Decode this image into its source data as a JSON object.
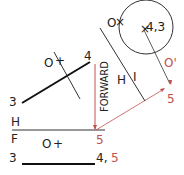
{
  "diagram": {
    "type": "descriptive-geometry-projection",
    "colors": {
      "ink": "#222222",
      "construction": "#c0504d",
      "background": "#ffffff"
    },
    "fold_lines": {
      "hf": {
        "top_label": "H",
        "bottom_label": "F"
      },
      "h1": {
        "left_label": "H",
        "right_label": "I"
      }
    },
    "direction_label": "FORWARD",
    "top_view": {
      "point_3": "3",
      "point_4": "4",
      "origin_label": "O"
    },
    "front_view": {
      "point_3": "3",
      "point_45_a": "4,",
      "point_45_b": "5",
      "origin_label": "O",
      "fold_point": "5"
    },
    "aux_view": {
      "point_43": "4,3",
      "origin_label": "O",
      "origin_prime_label": "O'",
      "point_5": "5"
    }
  }
}
